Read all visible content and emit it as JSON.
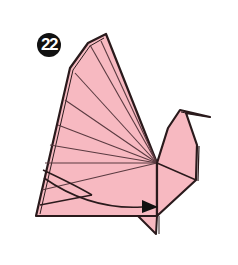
{
  "diagram": {
    "step_number": "22",
    "colors": {
      "paper": "#f7b9c1",
      "outline": "#2a1a1c",
      "crease": "#5a3a40",
      "badge_bg": "#111111",
      "badge_text": "#ffffff",
      "background": "#ffffff"
    },
    "annotations": {
      "fold_arrow": "curved-arrow-right",
      "fold_line": "dashed-vertical-valley-fold"
    }
  }
}
